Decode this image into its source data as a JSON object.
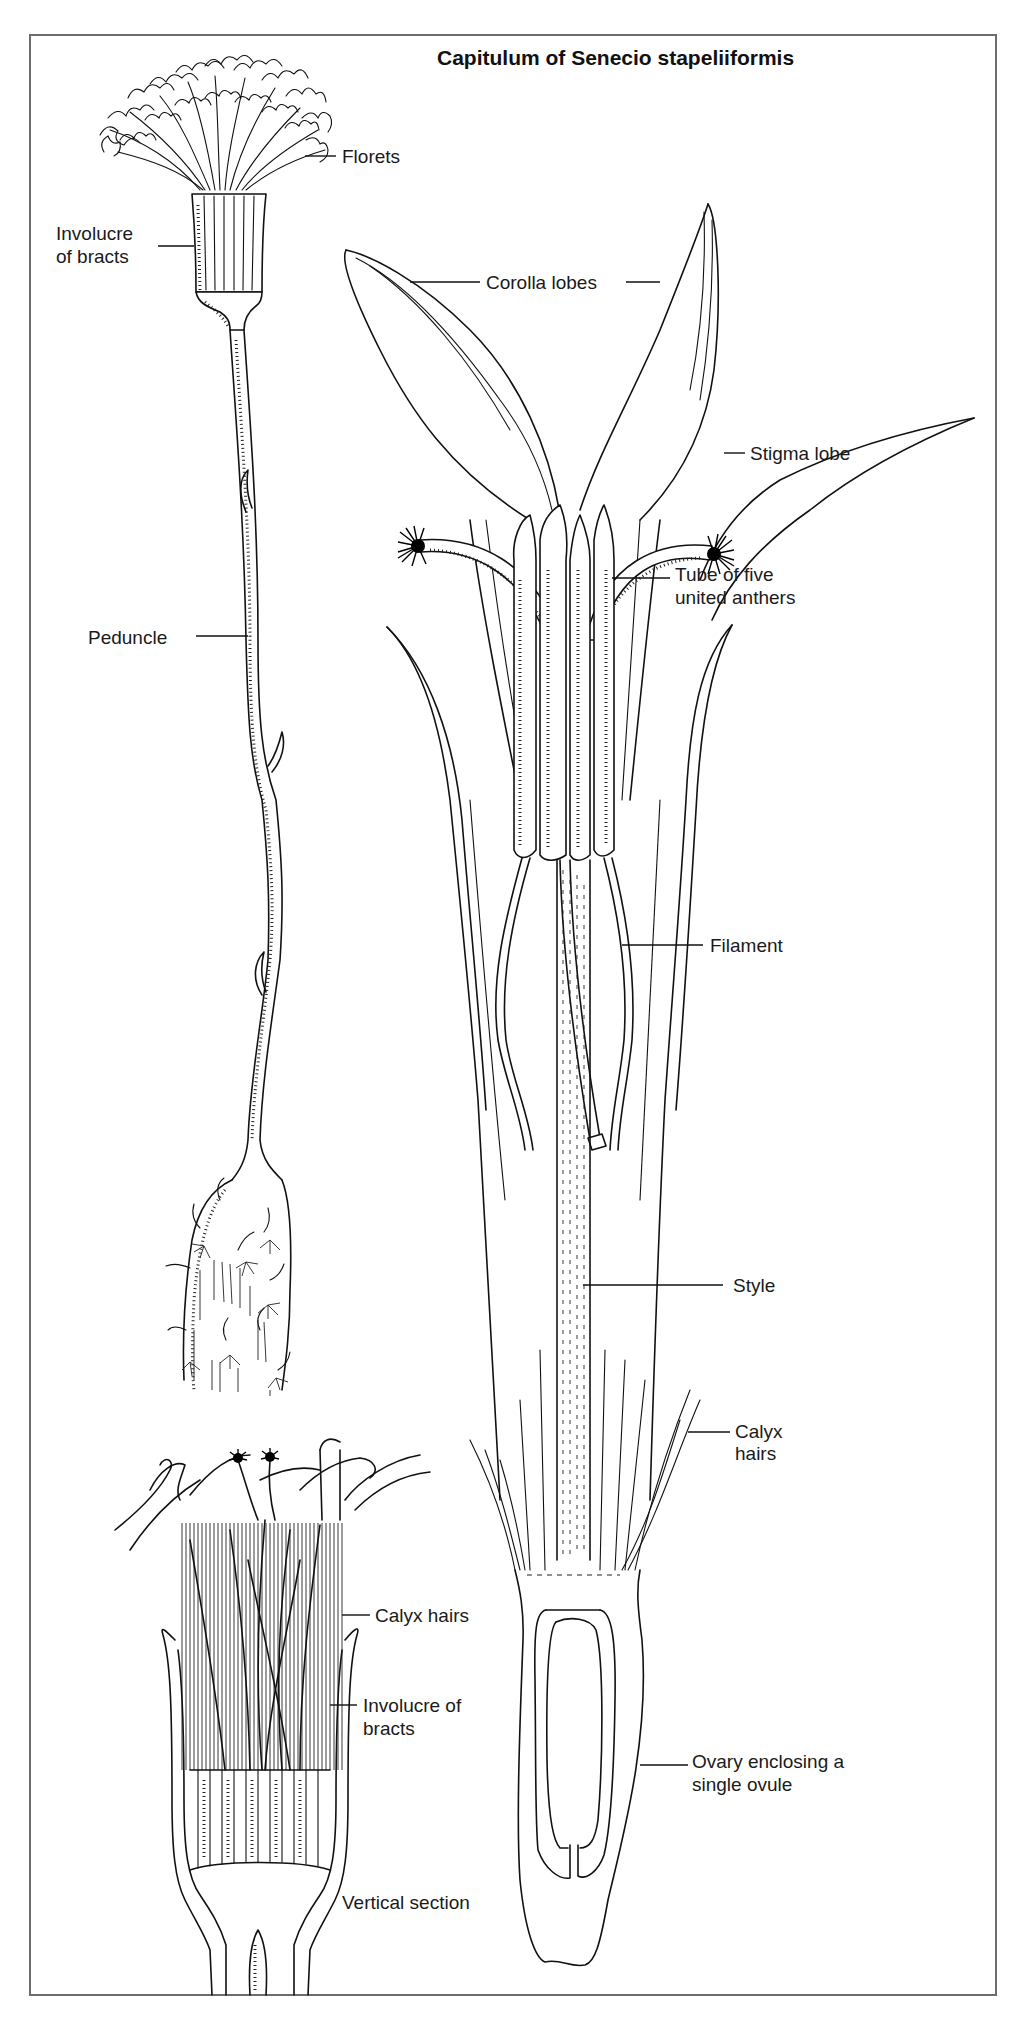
{
  "figure": {
    "title": "Capitulum of Senecio stapeliiformis",
    "frame_color": "#6d6d6d",
    "ink_color": "#111111",
    "background": "#ffffff"
  },
  "labels": {
    "florets": "Florets",
    "involucre_top_line1": "Involucre",
    "involucre_top_line2": "of bracts",
    "corolla_lobes": "Corolla lobes",
    "stigma_lobe": "Stigma lobe",
    "anther_tube_line1": "Tube of five",
    "anther_tube_line2": "united anthers",
    "peduncle": "Peduncle",
    "filament": "Filament",
    "style": "Style",
    "calyx_hairs_right_line1": "Calyx",
    "calyx_hairs_right_line2": "hairs",
    "calyx_hairs_section": "Calyx hairs",
    "involucre_section_line1": "Involucre of",
    "involucre_section_line2": "bracts",
    "ovary_line1": "Ovary enclosing a",
    "ovary_line2": "single ovule",
    "vertical_section": "Vertical section"
  },
  "panels": [
    {
      "id": "whole-capitulum",
      "description": "Capitulum on peduncle arising from stem"
    },
    {
      "id": "single-floret",
      "description": "Enlarged single disc floret"
    },
    {
      "id": "vertical-section",
      "description": "Vertical section of capitulum"
    }
  ]
}
